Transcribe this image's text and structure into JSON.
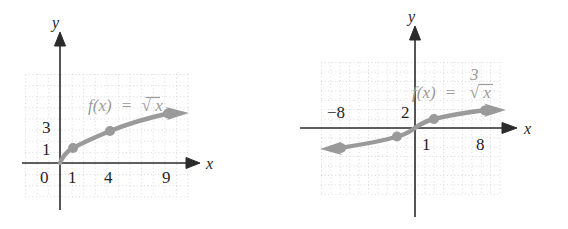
{
  "figure": {
    "panels": [
      {
        "id": "sqrt",
        "function_label": {
          "fx": "f(x)",
          "equals": "=",
          "radical": "√",
          "radicand": "x",
          "index": ""
        },
        "axes": {
          "x_label": "x",
          "y_label": "y"
        },
        "tick_labels": {
          "origin": "0",
          "x": [
            "1",
            "4",
            "9"
          ],
          "y": [
            "1",
            "3"
          ]
        },
        "colors": {
          "curve": "#9a9a9a",
          "axis": "#2b2b2b",
          "grid": "#cfcfcf"
        }
      },
      {
        "id": "cbrt",
        "function_label": {
          "fx": "f(x)",
          "equals": "=",
          "radical": "√",
          "radicand": "x",
          "index": "3"
        },
        "axes": {
          "x_label": "x",
          "y_label": "y"
        },
        "tick_labels": {
          "origin": "",
          "x": [
            "−8",
            "8"
          ],
          "y": [
            "2",
            "1"
          ]
        },
        "colors": {
          "curve": "#9a9a9a",
          "axis": "#2b2b2b",
          "grid": "#cfcfcf"
        }
      }
    ]
  },
  "chart_data": [
    {
      "type": "line",
      "id": "sqrt-graph",
      "title": "f(x) = √x",
      "xlabel": "x",
      "ylabel": "y",
      "xlim": [
        -1,
        11
      ],
      "ylim": [
        -1.6,
        4.2
      ],
      "grid": true,
      "legend": "none",
      "annotations": [
        "f(x) = √x"
      ],
      "xticks": [
        0,
        1,
        4,
        9
      ],
      "xtick_labels": [
        "0",
        "1",
        "4",
        "9"
      ],
      "yticks": [
        1,
        3
      ],
      "ytick_labels": [
        "1",
        "3"
      ],
      "series": [
        {
          "name": "f(x) = sqrt(x)",
          "x": [
            0,
            1,
            4,
            9
          ],
          "y": [
            0,
            1,
            2,
            3
          ],
          "marked_points": [
            [
              1,
              1
            ],
            [
              4,
              2
            ],
            [
              9,
              3
            ]
          ],
          "arrow_end": "right",
          "color": "#9a9a9a"
        }
      ]
    },
    {
      "type": "line",
      "id": "cbrt-graph",
      "title": "f(x) = ∛ x",
      "xlabel": "x",
      "ylabel": "y",
      "xlim": [
        -11,
        11
      ],
      "ylim": [
        -4,
        4
      ],
      "grid": true,
      "legend": "none",
      "annotations": [
        "f(x) = ∛ x"
      ],
      "xticks": [
        -8,
        8
      ],
      "xtick_labels": [
        "−8",
        "8"
      ],
      "yticks": [
        2,
        1
      ],
      "ytick_labels": [
        "2",
        "1"
      ],
      "series": [
        {
          "name": "f(x) = cbrt(x)",
          "x": [
            -8,
            -1,
            0,
            1,
            8
          ],
          "y": [
            -2,
            -1,
            0,
            1,
            2
          ],
          "marked_points": [
            [
              -8,
              -2
            ],
            [
              -1,
              -1
            ],
            [
              1,
              1
            ],
            [
              8,
              2
            ]
          ],
          "arrow_end": "both",
          "color": "#9a9a9a"
        }
      ]
    }
  ]
}
